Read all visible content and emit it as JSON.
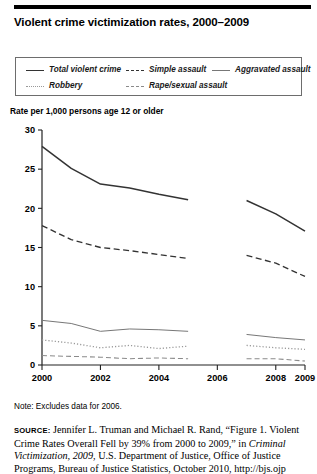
{
  "figure": {
    "title": "Violent crime victimization rates, 2000–2009",
    "y_caption": "Rate per 1,000 persons age 12 or older",
    "note": "Note: Excludes data for 2006.",
    "source_label": "source:",
    "source_text_1": " Jennifer L. Truman and Michael R. Rand, “Figure 1. Violent Crime Rates Overall Fell by 39% from 2000 to 2009,” in ",
    "source_italic_1": "Criminal Victimization, 2009",
    "source_text_2": ", U.S. Department of Justice, Office of Justice Programs, Bureau of Justice Statistics, October 2010, http://bjs.ojp"
  },
  "legend": {
    "items": [
      {
        "label": "Total violent crime",
        "style": "solid-thick",
        "color": "#333333"
      },
      {
        "label": "Simple assault",
        "style": "dashed",
        "color": "#333333"
      },
      {
        "label": "Aggravated assault",
        "style": "solid-thin",
        "color": "#777777"
      },
      {
        "label": "Robbery",
        "style": "dotted",
        "color": "#999999"
      },
      {
        "label": "Rape/sexual assault",
        "style": "dashdot",
        "color": "#8a8a8a"
      }
    ]
  },
  "chart_data": {
    "type": "line",
    "title": "Violent crime victimization rates, 2000–2009",
    "xlabel": "",
    "ylabel": "Rate per 1,000 persons age 12 or older",
    "xlim": [
      2000,
      2009
    ],
    "ylim": [
      0,
      30
    ],
    "yticks": [
      0,
      5,
      10,
      15,
      20,
      25,
      30
    ],
    "xticks": [
      2000,
      2002,
      2004,
      2006,
      2008,
      2009
    ],
    "xtick_labels": [
      "2000",
      "2002",
      "2004",
      "2006",
      "2008",
      "2009"
    ],
    "ytick_labels": [
      "0",
      "5",
      "10",
      "15",
      "20",
      "25",
      "30"
    ],
    "grid": false,
    "legend_position": "above-plot",
    "excluded_years": [
      2006
    ],
    "x": [
      2000,
      2001,
      2002,
      2003,
      2004,
      2005,
      2007,
      2008,
      2009
    ],
    "series": [
      {
        "name": "Total violent crime",
        "style": "solid-thick",
        "color": "#333333",
        "values": [
          27.9,
          25.1,
          23.1,
          22.6,
          21.8,
          21.1,
          21.0,
          19.3,
          17.1
        ]
      },
      {
        "name": "Simple assault",
        "style": "dashed",
        "color": "#333333",
        "values": [
          17.8,
          16.0,
          15.0,
          14.6,
          14.1,
          13.6,
          14.0,
          13.0,
          11.3
        ]
      },
      {
        "name": "Aggravated assault",
        "style": "solid-thin",
        "color": "#777777",
        "values": [
          5.7,
          5.3,
          4.3,
          4.6,
          4.5,
          4.3,
          3.9,
          3.5,
          3.2
        ]
      },
      {
        "name": "Robbery",
        "style": "dotted",
        "color": "#999999",
        "values": [
          3.2,
          2.8,
          2.2,
          2.5,
          2.1,
          2.4,
          2.5,
          2.2,
          2.0
        ]
      },
      {
        "name": "Rape/sexual assault",
        "style": "dashdot",
        "color": "#8a8a8a",
        "values": [
          1.2,
          1.1,
          1.0,
          0.8,
          0.9,
          0.8,
          0.8,
          0.8,
          0.5
        ]
      }
    ]
  }
}
